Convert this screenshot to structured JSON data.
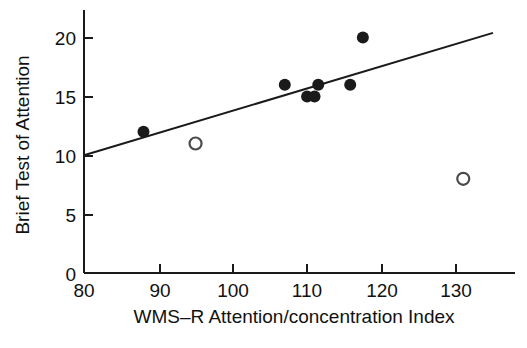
{
  "chart_data": {
    "type": "scatter",
    "title": "",
    "xlabel": "WMS–R Attention/concentration Index",
    "ylabel": "Brief Test of Attention",
    "xlim": [
      80,
      135
    ],
    "ylim": [
      0,
      22
    ],
    "xticks": [
      80,
      90,
      100,
      110,
      120,
      130
    ],
    "xtick_labels": [
      "80",
      "90",
      "100",
      "110",
      "120",
      "130"
    ],
    "yticks": [
      0,
      5,
      10,
      15,
      20
    ],
    "ytick_labels": [
      "0",
      "5",
      "10",
      "15",
      "20"
    ],
    "grid": false,
    "legend": null,
    "series": [
      {
        "name": "filled-markers",
        "marker": "filled-circle",
        "color": "#1a1a1a",
        "points": [
          {
            "x": 88,
            "y": 12
          },
          {
            "x": 107,
            "y": 16
          },
          {
            "x": 110,
            "y": 15
          },
          {
            "x": 111,
            "y": 15
          },
          {
            "x": 111.5,
            "y": 16
          },
          {
            "x": 115.8,
            "y": 16
          },
          {
            "x": 117.5,
            "y": 20
          }
        ]
      },
      {
        "name": "open-markers",
        "marker": "open-circle",
        "color": "#4a4a4a",
        "points": [
          {
            "x": 95,
            "y": 11
          },
          {
            "x": 131,
            "y": 8
          }
        ]
      }
    ],
    "trendline": {
      "name": "regression-line",
      "color": "#1a1a1a",
      "x_start": 80,
      "y_start": 10,
      "x_end": 135,
      "y_end": 20.4
    }
  },
  "axes": {
    "y_axis_label": "Brief Test of Attention",
    "x_axis_label": "WMS–R Attention/concentration Index",
    "y_tick_0": "0",
    "y_tick_5": "5",
    "y_tick_10": "10",
    "y_tick_15": "15",
    "y_tick_20": "20",
    "x_tick_80": "80",
    "x_tick_90": "90",
    "x_tick_100": "100",
    "x_tick_110": "110",
    "x_tick_120": "120",
    "x_tick_130": "130"
  }
}
